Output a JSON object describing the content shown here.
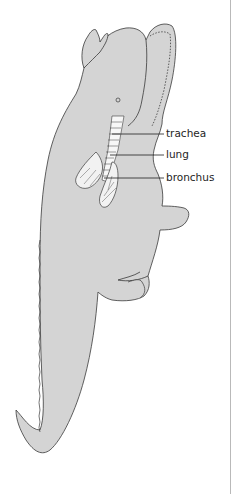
{
  "figure": {
    "colors": {
      "body_fill": "#d4d4d4",
      "outline": "#3a3a3a",
      "lung_fill": "#f2f2f2",
      "trachea_fill": "#f7f7f7",
      "label_text": "#1e1e1e",
      "edge_line": "#b9b9b9"
    },
    "labels": [
      {
        "id": "trachea",
        "text": "trachea"
      },
      {
        "id": "lung",
        "text": "lung"
      },
      {
        "id": "bronchus",
        "text": "bronchus"
      }
    ]
  }
}
